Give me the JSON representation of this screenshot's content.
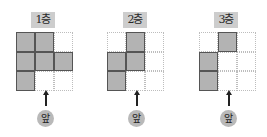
{
  "colors": {
    "filled_cell": "#b3b3b3",
    "cell_border": "#555555",
    "empty_border": "#bdbdbd",
    "label_bg": "#cdcdcd",
    "front_badge_bg": "#b9b9b9"
  },
  "panels": [
    {
      "label": "1층",
      "front_label": "앞",
      "grid": [
        [
          1,
          1,
          0
        ],
        [
          1,
          1,
          1
        ],
        [
          1,
          0,
          0
        ]
      ]
    },
    {
      "label": "2층",
      "front_label": "앞",
      "grid": [
        [
          0,
          1,
          0
        ],
        [
          1,
          1,
          0
        ],
        [
          1,
          0,
          0
        ]
      ]
    },
    {
      "label": "3층",
      "front_label": "앞",
      "grid": [
        [
          0,
          1,
          0
        ],
        [
          1,
          0,
          0
        ],
        [
          1,
          0,
          0
        ]
      ]
    }
  ]
}
